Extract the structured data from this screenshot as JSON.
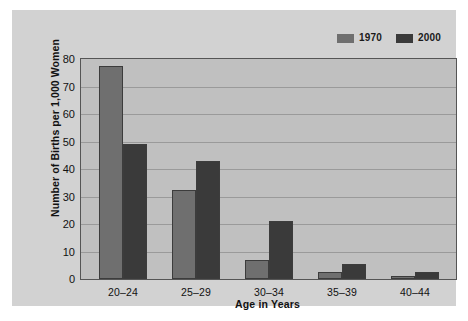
{
  "chart_data": {
    "type": "bar",
    "title": "",
    "xlabel": "Age in Years",
    "ylabel": "Number of Births per 1,000 Women",
    "categories": [
      "20–24",
      "25–29",
      "30–34",
      "35–39",
      "40–44"
    ],
    "series": [
      {
        "name": "1970",
        "color": "#6f6f6f",
        "values": [
          77.5,
          32.5,
          7,
          2.5,
          1
        ]
      },
      {
        "name": "2000",
        "color": "#3a3a3a",
        "values": [
          49,
          43,
          21,
          5.5,
          2.5
        ]
      }
    ],
    "ylim": [
      0,
      80
    ],
    "yticks": [
      0,
      10,
      20,
      30,
      40,
      50,
      60,
      70,
      80
    ],
    "ytick_labels": [
      "0",
      "10",
      "20",
      "30",
      "40",
      "50",
      "60",
      "70",
      "80"
    ],
    "grid": true,
    "legend_position": "top-right",
    "plot_background": "#c0c0c0",
    "panel_background": "#d2d2d2",
    "axis_color": "#555555",
    "gridline_color": "#9a9a9a"
  },
  "legend": {
    "entries": [
      {
        "label": "1970",
        "swatch": "#6f6f6f"
      },
      {
        "label": "2000",
        "swatch": "#3a3a3a"
      }
    ]
  }
}
